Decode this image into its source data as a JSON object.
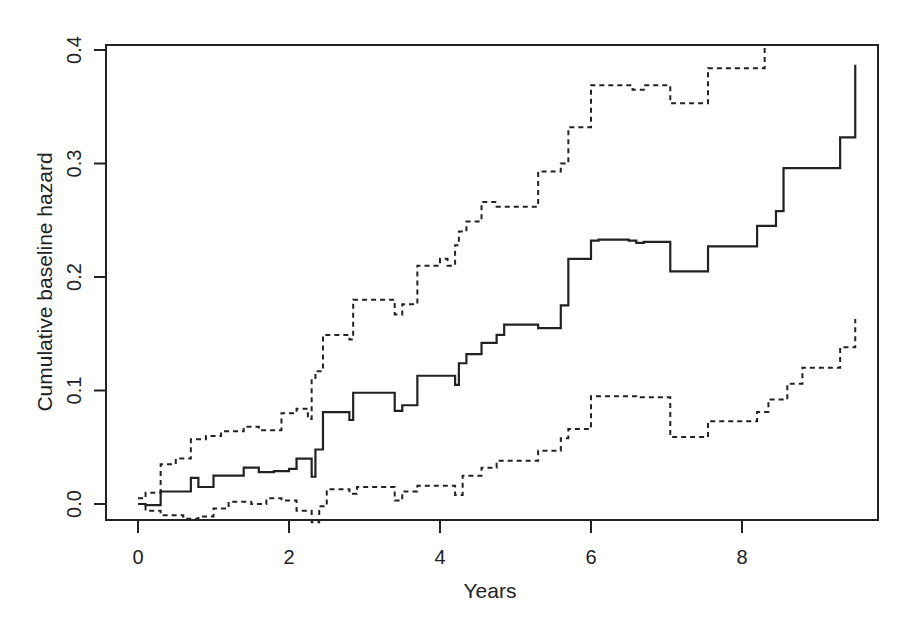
{
  "chart_data": {
    "type": "line",
    "title": "",
    "xlabel": "Years",
    "ylabel": "Cumulative baseline hazard",
    "xlim": [
      -0.4,
      9.8
    ],
    "ylim": [
      -0.014,
      0.405
    ],
    "x_ticks": [
      0,
      2,
      4,
      6,
      8
    ],
    "x_tick_labels": [
      "0",
      "2",
      "4",
      "6",
      "8"
    ],
    "y_ticks": [
      0.0,
      0.1,
      0.2,
      0.3,
      0.4
    ],
    "y_tick_labels": [
      "0.0",
      "0.1",
      "0.2",
      "0.3",
      "0.4"
    ],
    "grid": false,
    "legend": null,
    "step": true,
    "series": [
      {
        "name": "Cumulative baseline hazard (estimate)",
        "style": "solid",
        "x": [
          0.0,
          0.1,
          0.3,
          0.5,
          0.7,
          0.8,
          1.0,
          1.2,
          1.4,
          1.6,
          1.8,
          2.0,
          2.1,
          2.3,
          2.35,
          2.45,
          2.8,
          2.85,
          3.4,
          3.5,
          3.7,
          4.2,
          4.25,
          4.35,
          4.55,
          4.75,
          4.85,
          5.3,
          5.6,
          5.7,
          6.0,
          6.1,
          6.5,
          6.6,
          6.7,
          7.05,
          7.55,
          8.2,
          8.45,
          8.55,
          8.8,
          9.3,
          9.5
        ],
        "y": [
          0.0,
          -0.001,
          0.011,
          0.011,
          0.023,
          0.015,
          0.025,
          0.025,
          0.032,
          0.028,
          0.029,
          0.031,
          0.04,
          0.024,
          0.048,
          0.081,
          0.074,
          0.098,
          0.082,
          0.087,
          0.113,
          0.105,
          0.124,
          0.132,
          0.142,
          0.149,
          0.158,
          0.155,
          0.175,
          0.216,
          0.232,
          0.233,
          0.232,
          0.23,
          0.231,
          0.205,
          0.227,
          0.245,
          0.258,
          0.296,
          0.296,
          0.323,
          0.387
        ]
      },
      {
        "name": "Upper 95% CI",
        "style": "dashed",
        "x": [
          0.0,
          0.1,
          0.3,
          0.5,
          0.7,
          0.9,
          1.1,
          1.4,
          1.6,
          1.9,
          2.1,
          2.25,
          2.3,
          2.35,
          2.45,
          2.8,
          2.85,
          3.4,
          3.5,
          3.7,
          4.0,
          4.1,
          4.2,
          4.25,
          4.35,
          4.55,
          4.75,
          5.3,
          5.6,
          5.7,
          6.0,
          6.55,
          6.7,
          7.05,
          7.55,
          8.3
        ],
        "y": [
          0.005,
          0.01,
          0.035,
          0.04,
          0.057,
          0.06,
          0.064,
          0.068,
          0.065,
          0.08,
          0.084,
          0.075,
          0.11,
          0.117,
          0.149,
          0.145,
          0.18,
          0.167,
          0.176,
          0.21,
          0.216,
          0.21,
          0.228,
          0.24,
          0.249,
          0.266,
          0.262,
          0.293,
          0.3,
          0.332,
          0.369,
          0.365,
          0.369,
          0.353,
          0.384,
          0.402
        ]
      },
      {
        "name": "Lower 95% CI",
        "style": "dashed",
        "x": [
          0.0,
          0.1,
          0.3,
          0.6,
          0.8,
          1.0,
          1.2,
          1.5,
          1.7,
          1.9,
          2.1,
          2.3,
          2.4,
          2.5,
          2.8,
          2.9,
          3.4,
          3.5,
          3.7,
          4.2,
          4.3,
          4.55,
          4.75,
          5.3,
          5.6,
          5.7,
          6.0,
          6.6,
          6.7,
          7.05,
          7.55,
          8.2,
          8.35,
          8.6,
          8.8,
          9.3,
          9.5
        ],
        "y": [
          0.0,
          -0.006,
          -0.01,
          -0.013,
          -0.011,
          -0.004,
          0.002,
          0.0,
          0.005,
          0.003,
          -0.006,
          -0.016,
          -0.002,
          0.013,
          0.009,
          0.015,
          0.003,
          0.011,
          0.016,
          0.008,
          0.025,
          0.032,
          0.038,
          0.047,
          0.058,
          0.066,
          0.095,
          0.094,
          0.094,
          0.059,
          0.073,
          0.081,
          0.092,
          0.106,
          0.12,
          0.138,
          0.163
        ]
      }
    ]
  }
}
